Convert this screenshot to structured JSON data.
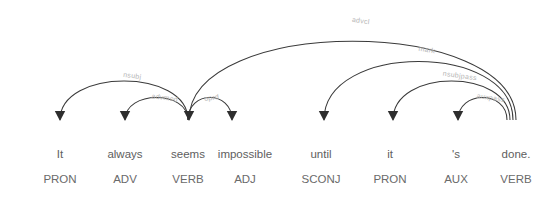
{
  "visualization": {
    "type": "dependency-parse",
    "title": "",
    "background_color": "#ffffff",
    "arc_color": "#3a3a3a",
    "label_color": "#b4b4b4",
    "word_color": "#5e5e5e",
    "tag_color": "#6a6a6a",
    "width": 550,
    "height": 202
  },
  "words": [
    {
      "index": 0,
      "text": "It",
      "tag": "PRON",
      "x": 60
    },
    {
      "index": 1,
      "text": "always",
      "tag": "ADV",
      "x": 125
    },
    {
      "index": 2,
      "text": "seems",
      "tag": "VERB",
      "x": 188
    },
    {
      "index": 3,
      "text": "impossible",
      "tag": "ADJ",
      "x": 245
    },
    {
      "index": 4,
      "text": "until",
      "tag": "SCONJ",
      "x": 321
    },
    {
      "index": 5,
      "text": "it",
      "tag": "PRON",
      "x": 390
    },
    {
      "index": 6,
      "text": "'s",
      "tag": "AUX",
      "x": 456
    },
    {
      "index": 7,
      "text": "done.",
      "tag": "VERB",
      "x": 516
    }
  ],
  "word_baseline_y": 158,
  "tag_baseline_y": 183,
  "arcs": [
    {
      "id": "arc-nsubj",
      "label": "nsubj",
      "head": 2,
      "child": 0,
      "dir": "left",
      "level": 2,
      "start_x": 188,
      "end_x": 60,
      "apex_y": 68
    },
    {
      "id": "arc-advmod",
      "label": "advmod",
      "head": 2,
      "child": 1,
      "dir": "left",
      "level": 1,
      "start_x": 188,
      "end_x": 125,
      "apex_y": 90
    },
    {
      "id": "arc-oprd",
      "label": "oprd",
      "head": 2,
      "child": 3,
      "dir": "right",
      "level": 1,
      "start_x": 188,
      "end_x": 232,
      "apex_y": 90
    },
    {
      "id": "arc-advcl",
      "label": "advcl",
      "head": 7,
      "child": 2,
      "dir": "left",
      "level": 4,
      "start_x": 516,
      "end_x": 189,
      "apex_y": 15
    },
    {
      "id": "arc-mark",
      "label": "mark",
      "head": 7,
      "child": 4,
      "dir": "left",
      "level": 3,
      "start_x": 513,
      "end_x": 324,
      "apex_y": 42
    },
    {
      "id": "arc-nsubjpass",
      "label": "nsubjpass",
      "head": 7,
      "child": 5,
      "dir": "left",
      "level": 2,
      "start_x": 510,
      "end_x": 393,
      "apex_y": 68
    },
    {
      "id": "arc-auxpass",
      "label": "auxpass",
      "head": 7,
      "child": 6,
      "dir": "left",
      "level": 1,
      "start_x": 507,
      "end_x": 458,
      "apex_y": 90
    }
  ],
  "sentence": "It always seems impossible until it 's done."
}
